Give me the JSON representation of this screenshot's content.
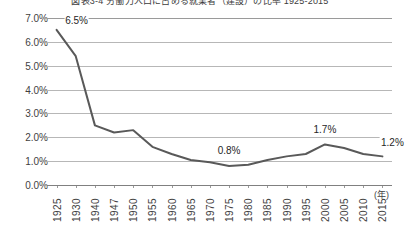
{
  "chart_data": {
    "type": "line",
    "title": "図表3-4 労働力人口に占める就業者（建設）の比率 1925-2015",
    "xlabel": "(年)",
    "ylabel": "",
    "ylim": [
      0.0,
      7.0
    ],
    "ytick_step": 1.0,
    "ytick_labels": [
      "7.0%",
      "6.0%",
      "5.0%",
      "4.0%",
      "3.0%",
      "2.0%",
      "1.0%",
      "0.0%"
    ],
    "ytick_values": [
      7.0,
      6.0,
      5.0,
      4.0,
      3.0,
      2.0,
      1.0,
      0.0
    ],
    "grid": true,
    "legend": "none",
    "categories": [
      "1925",
      "1930",
      "1940",
      "1947",
      "1950",
      "1955",
      "1960",
      "1965",
      "1970",
      "1975",
      "1980",
      "1985",
      "1990",
      "1995",
      "2000",
      "2005",
      "2010",
      "2015"
    ],
    "values": [
      6.5,
      5.4,
      2.5,
      2.2,
      2.3,
      1.6,
      1.3,
      1.05,
      0.95,
      0.8,
      0.85,
      1.05,
      1.2,
      1.3,
      1.7,
      1.55,
      1.3,
      1.2
    ],
    "series": [
      {
        "name": "労働力人口に占める就業者（建設）の比率",
        "values": [
          6.5,
          5.4,
          2.5,
          2.2,
          2.3,
          1.6,
          1.3,
          1.05,
          0.95,
          0.8,
          0.85,
          1.05,
          1.2,
          1.3,
          1.7,
          1.55,
          1.3,
          1.2
        ],
        "color": "#595959"
      }
    ],
    "annotations": [
      {
        "label": "6.5%",
        "category": "1925",
        "value": 6.5
      },
      {
        "label": "0.8%",
        "category": "1975",
        "value": 0.8
      },
      {
        "label": "1.7%",
        "category": "2000",
        "value": 1.7
      },
      {
        "label": "1.2%",
        "category": "2015",
        "value": 1.2
      }
    ]
  },
  "colors": {
    "line": "#595959",
    "grid": "#b7b7b7",
    "axis": "#808080",
    "text": "#3f3f3f"
  }
}
